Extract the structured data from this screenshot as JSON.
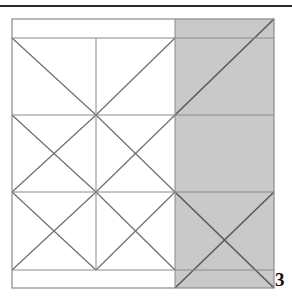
{
  "figure": {
    "number_label": "3",
    "caption": "",
    "colors": {
      "stroke": "#6e6e6e",
      "stroke_dark": "#5a5a5a",
      "shaded_fill": "#c9c9c9",
      "unshaded_fill": "#ffffff",
      "rule": "#2a2a2a",
      "label_color": "#111111",
      "page_background": "#ffffff"
    },
    "top_rule": {
      "name": "horizontal-rule",
      "x1": 0,
      "y1": 6,
      "x2": 292,
      "y2": 6,
      "thickness": 2
    },
    "outer_square": {
      "x": 12,
      "y": 19,
      "width": 262,
      "height": 269
    },
    "bands": {
      "top_band": {
        "y_top": 19,
        "y_bottom": 38
      },
      "bottom_band": {
        "y_top": 270,
        "y_bottom": 288
      }
    },
    "grid": {
      "vertical_lines_x": [
        12,
        96,
        175,
        274
      ],
      "horizontal_lines_y": [
        19,
        38,
        115,
        192,
        270,
        288
      ],
      "shade_boundary_x": 175
    },
    "shaded_region": {
      "name": "shaded-right-column",
      "x": 175,
      "y": 19,
      "width": 99,
      "height": 269,
      "fill": "#c9c9c9"
    },
    "cells": [
      {
        "id": "r1c1",
        "shaded": false,
        "pattern": "half-diagonal-down"
      },
      {
        "id": "r1c2",
        "shaded": false,
        "pattern": "half-diagonal-up"
      },
      {
        "id": "r1c3",
        "shaded": true,
        "pattern": "diagonal-up"
      },
      {
        "id": "r2c1",
        "shaded": false,
        "pattern": "cross"
      },
      {
        "id": "r2c2",
        "shaded": false,
        "pattern": "cross"
      },
      {
        "id": "r2c3",
        "shaded": true,
        "pattern": "none"
      },
      {
        "id": "r3c1",
        "shaded": false,
        "pattern": "cross"
      },
      {
        "id": "r3c2",
        "shaded": false,
        "pattern": "cross"
      },
      {
        "id": "r3c3",
        "shaded": true,
        "pattern": "cross"
      }
    ]
  }
}
